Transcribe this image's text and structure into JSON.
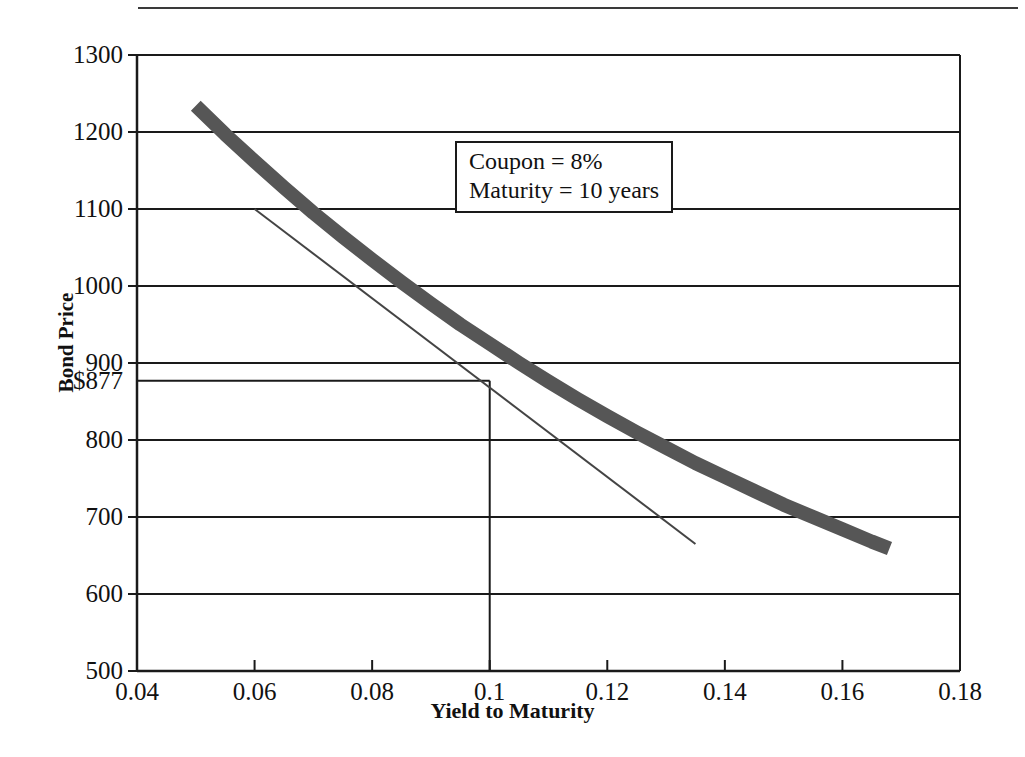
{
  "figure": {
    "name": "bond-price-yield-curve",
    "background": "#ffffff",
    "rule_color": "#3a3a3a"
  },
  "axis_titles": {
    "x": "Yield to Maturity",
    "y": "Bond Price"
  },
  "annotation": {
    "line1": "Coupon = 8%",
    "line2": "Maturity = 10 years"
  },
  "reference": {
    "price_label": "$877",
    "price_value": 877,
    "yield_value": 0.1
  },
  "chart_data": {
    "type": "line",
    "title": "",
    "xlabel": "Yield to Maturity",
    "ylabel": "Bond Price",
    "xlim": [
      0.04,
      0.18
    ],
    "ylim": [
      500,
      1300
    ],
    "xticks": [
      0.04,
      0.06,
      0.08,
      0.1,
      0.12,
      0.14,
      0.16,
      0.18
    ],
    "xtick_labels": [
      "0.04",
      "0.06",
      "0.08",
      "0.1",
      "0.12",
      "0.14",
      "0.16",
      "0.18"
    ],
    "yticks": [
      500,
      600,
      700,
      800,
      900,
      1000,
      1100,
      1200,
      1300
    ],
    "ytick_labels": [
      "500",
      "600",
      "700",
      "800",
      "900",
      "1000",
      "1100",
      "1200",
      "1300"
    ],
    "extra_ytick": {
      "value": 877,
      "label": "$877"
    },
    "grid": {
      "horizontal": true,
      "vertical": false
    },
    "legend": null,
    "series": [
      {
        "name": "bond-price-curve",
        "type": "line",
        "color": "#565656",
        "width_px": 14,
        "x": [
          0.05,
          0.055,
          0.06,
          0.065,
          0.07,
          0.075,
          0.08,
          0.085,
          0.09,
          0.095,
          0.1,
          0.105,
          0.11,
          0.115,
          0.12,
          0.125,
          0.13,
          0.135,
          0.14,
          0.145,
          0.15,
          0.155,
          0.16,
          0.165,
          0.168
        ],
        "values": [
          1234,
          1197,
          1162,
          1128,
          1095,
          1064,
          1034,
          1005,
          977,
          950,
          925,
          900,
          876,
          853,
          831,
          810,
          790,
          770,
          752,
          734,
          716,
          700,
          684,
          668,
          659
        ]
      },
      {
        "name": "tangent-line",
        "type": "line",
        "color": "#444444",
        "width_px": 2,
        "x": [
          0.06,
          0.135
        ],
        "values": [
          1100,
          665
        ]
      }
    ],
    "reference_lines": [
      {
        "name": "price-reference-horizontal",
        "orientation": "horizontal",
        "value": 877,
        "from_x": 0.04,
        "to_x": 0.1,
        "color": "#1a1a1a"
      },
      {
        "name": "yield-reference-vertical",
        "orientation": "vertical",
        "value": 0.1,
        "from_y": 500,
        "to_y": 877,
        "color": "#1a1a1a"
      }
    ],
    "annotations": [
      {
        "name": "bond-terms-box",
        "text": [
          "Coupon = 8%",
          "Maturity = 10 years"
        ],
        "x": 0.104,
        "y": 1168
      }
    ]
  }
}
